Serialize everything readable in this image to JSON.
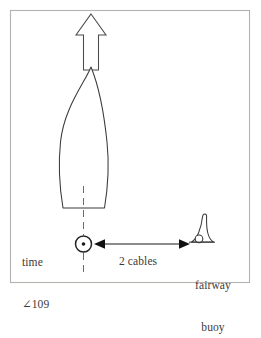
{
  "figure": {
    "name": "ship-fix-and-fairway-buoy-diagram",
    "frame": {
      "border_color": "#b4b2b0",
      "background_color": "#ffffff"
    },
    "ink_color": "#3a3a3a"
  },
  "labels": {
    "time_line1": "time",
    "time_line2": "∠109",
    "distance": "2 cables",
    "buoy_line1": "fairway",
    "buoy_line2": "buoy"
  },
  "icons": {
    "heading_arrow": "up-arrow-icon",
    "ship": "ship-hull-icon",
    "fix": "fix-position-icon",
    "buoy": "fairway-buoy-icon",
    "range_left_head": "arrowhead-left-icon",
    "range_right_head": "arrowhead-right-icon",
    "centerline": "dashed-centerline-icon"
  }
}
